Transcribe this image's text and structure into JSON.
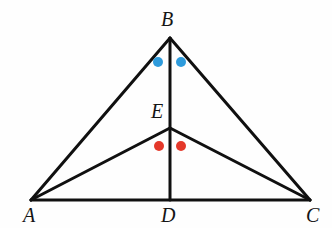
{
  "figure": {
    "kind": "euclidean-geometry-diagram",
    "background_color": "#fefefe",
    "stroke_color": "#101010",
    "stroke_width": 3,
    "canvas": {
      "width": 332,
      "height": 228
    }
  },
  "points": {
    "A": {
      "label": "A",
      "x": 31,
      "y": 200,
      "label_x": 23,
      "label_y": 205
    },
    "B": {
      "label": "B",
      "x": 170,
      "y": 38,
      "label_x": 161,
      "label_y": 9
    },
    "C": {
      "label": "C",
      "x": 310,
      "y": 200,
      "label_x": 306,
      "label_y": 205
    },
    "D": {
      "label": "D",
      "x": 170,
      "y": 200,
      "label_x": 161,
      "label_y": 205
    },
    "E": {
      "label": "E",
      "x": 170,
      "y": 128,
      "label_x": 151,
      "label_y": 101
    }
  },
  "segments": [
    {
      "name": "AB",
      "from": "A",
      "to": "B"
    },
    {
      "name": "BC",
      "from": "B",
      "to": "C"
    },
    {
      "name": "AC",
      "from": "A",
      "to": "C"
    },
    {
      "name": "BD",
      "from": "B",
      "to": "D"
    },
    {
      "name": "AE",
      "from": "A",
      "to": "E"
    },
    {
      "name": "EC",
      "from": "E",
      "to": "C"
    }
  ],
  "angle_marks": {
    "blue": {
      "color": "#2e9bdc",
      "radius": 5,
      "meaning": "equal angles at vertex B",
      "dots": [
        {
          "name": "angle-ABD-mark",
          "x": 158,
          "y": 62
        },
        {
          "name": "angle-DBC-mark",
          "x": 181,
          "y": 62
        }
      ]
    },
    "red": {
      "color": "#e4382a",
      "radius": 5,
      "meaning": "equal angles at vertex E",
      "dots": [
        {
          "name": "angle-AED-mark",
          "x": 159,
          "y": 146
        },
        {
          "name": "angle-DEC-mark",
          "x": 181,
          "y": 146
        }
      ]
    }
  }
}
